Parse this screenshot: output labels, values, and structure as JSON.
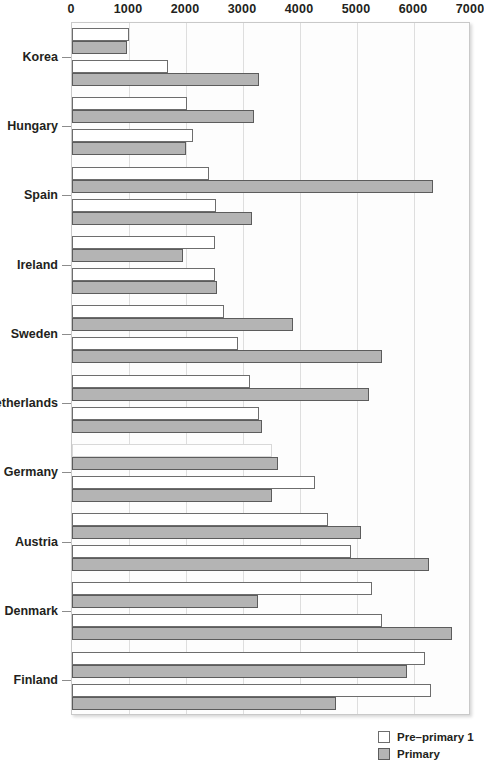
{
  "chart_data": {
    "type": "bar",
    "orientation": "horizontal",
    "title": "",
    "xlabel": "",
    "ylabel": "",
    "xlim": [
      0,
      7000
    ],
    "xticks": [
      0,
      1000,
      2000,
      3000,
      4000,
      5000,
      6000,
      7000
    ],
    "xtick_labels": [
      "0",
      "1000",
      "2000",
      "3000",
      "4000",
      "5000",
      "6000",
      "7000"
    ],
    "grid": true,
    "legend_position": "bottom-right",
    "categories": [
      "Korea",
      "Hungary",
      "Spain",
      "Ireland",
      "Sweden",
      "Netherlands",
      "Germany",
      "Austria",
      "Denmark",
      "Finland"
    ],
    "series": [
      {
        "name": "Pre-primary 1",
        "color": "#ffffff",
        "edge_color": "#6d6d6d",
        "group": "upper",
        "values": [
          1000,
          2010,
          2400,
          2500,
          2660,
          3120,
          3510,
          4490,
          5270,
          6200
        ]
      },
      {
        "name": "Primary",
        "color": "#b4b4b4",
        "edge_color": "#5c5c5c",
        "group": "upper",
        "values": [
          970,
          3190,
          6330,
          1940,
          3880,
          5210,
          3620,
          5070,
          3260,
          5880
        ]
      },
      {
        "name": "Pre-primary 1",
        "color": "#ffffff",
        "edge_color": "#6d6d6d",
        "group": "lower",
        "values": [
          1680,
          2120,
          2530,
          2500,
          2920,
          3280,
          4270,
          4900,
          5430,
          6290
        ]
      },
      {
        "name": "Primary",
        "color": "#b4b4b4",
        "edge_color": "#5c5c5c",
        "group": "lower",
        "values": [
          3280,
          2000,
          3160,
          2550,
          5430,
          3340,
          3500,
          6260,
          6660,
          4640
        ]
      }
    ]
  },
  "legend": {
    "items": [
      {
        "label": "Pre–primary 1",
        "swatch": "pre"
      },
      {
        "label": "Primary",
        "swatch": "prim"
      }
    ]
  }
}
